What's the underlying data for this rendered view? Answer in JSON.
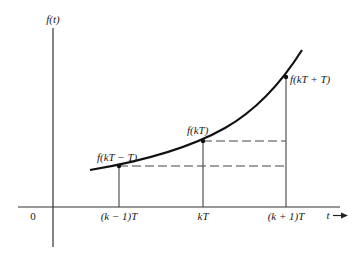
{
  "figure": {
    "y_axis_label": "f(t)",
    "x_axis_label": "t",
    "origin_label": "0",
    "tick_labels": [
      "(k − 1)T",
      "kT",
      "(k + 1)T"
    ],
    "point_labels": [
      "f(kT − T)",
      "f(kT)",
      "f(kT + T)"
    ],
    "colors": {
      "line": "#1a1a1a",
      "axis": "#333333",
      "dash": "#444444"
    }
  }
}
